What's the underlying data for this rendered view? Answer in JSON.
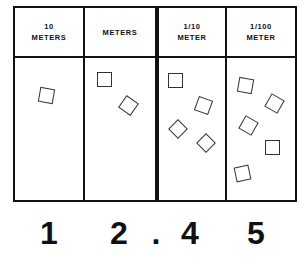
{
  "diagram": {
    "title": "",
    "columns": [
      {
        "label_lines": [
          "10",
          "METERS"
        ],
        "place": "tens",
        "count": 1,
        "digit": "1"
      },
      {
        "label_lines": [
          "METERS"
        ],
        "place": "ones",
        "count": 2,
        "digit": "2"
      },
      {
        "label_lines": [
          "1/10",
          "METER"
        ],
        "place": "tenths",
        "count": 4,
        "digit": "4"
      },
      {
        "label_lines": [
          "1/100",
          "METER"
        ],
        "place": "hundredths",
        "count": 5,
        "digit": "5"
      }
    ],
    "decimal_point": ".",
    "number": "12.45",
    "item_shape": "square-icon",
    "colors": {
      "ink": "#111111",
      "paper": "#ffffff"
    }
  }
}
